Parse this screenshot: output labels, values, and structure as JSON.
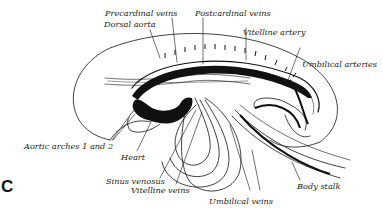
{
  "figure": {
    "panel_letter": "C",
    "labels": {
      "precardinal_veins": "Precardinal veins",
      "postcardinal_veins": "Postcardinal veins",
      "dorsal_aorta": "Dorsal aorta",
      "vitelline_artery": "Vitelline artery",
      "umbilical_arteries": "Umbilical arteries",
      "aortic_arches": "Aortic arches 1 and 2",
      "heart": "Heart",
      "sinus_venosus": "Sinus venosus",
      "vitelline_veins": "Vitelline veins",
      "umbilical_veins": "Umbilical veins",
      "body_stalk": "Body stalk"
    },
    "cut_off_text": "— — — — — —"
  },
  "colors": {
    "ink": "#111111",
    "paper": "#ffffff",
    "label": "#1a1a1a"
  }
}
